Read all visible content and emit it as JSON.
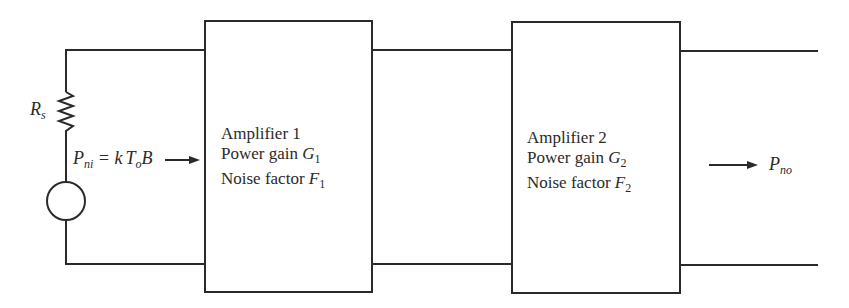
{
  "diagram": {
    "type": "cascaded amplifier noise circuit",
    "source": {
      "resistor_label": "R",
      "resistor_sub": "s",
      "input_power_label": "P",
      "input_power_sub": "ni",
      "equals": " = k",
      "temp_label": "T",
      "temp_sub": "o",
      "bandwidth": "B"
    },
    "amplifiers": [
      {
        "name": "Amplifier 1",
        "gain_label": "Power gain ",
        "gain_symbol": "G",
        "gain_sub": "1",
        "noise_label": "Noise factor ",
        "noise_symbol": "F",
        "noise_sub": "1"
      },
      {
        "name": "Amplifier 2",
        "gain_label": "Power gain ",
        "gain_symbol": "G",
        "gain_sub": "2",
        "noise_label": "Noise factor ",
        "noise_symbol": "F",
        "noise_sub": "2"
      }
    ],
    "output": {
      "power_label": "P",
      "power_sub": "no"
    },
    "colors": {
      "line": "#2a2a2a",
      "background": "#ffffff"
    }
  }
}
